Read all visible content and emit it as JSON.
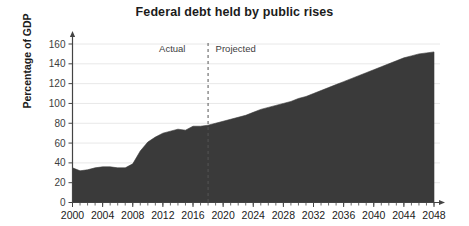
{
  "chart_data": {
    "type": "area",
    "title": "Federal debt held by public rises",
    "xlabel": "",
    "ylabel": "Percentage of GDP",
    "xlim": [
      2000,
      2048
    ],
    "ylim": [
      0,
      160
    ],
    "grid": true,
    "legend_position": "none",
    "yticks": [
      0,
      20,
      40,
      60,
      80,
      100,
      120,
      140,
      160
    ],
    "ytick_labels": [
      "0",
      "20",
      "40",
      "60",
      "80",
      "100",
      "120",
      "140",
      "160"
    ],
    "xticks": [
      2000,
      2004,
      2008,
      2012,
      2016,
      2020,
      2024,
      2028,
      2032,
      2036,
      2040,
      2044,
      2048
    ],
    "xtick_labels": [
      "2000",
      "2004",
      "2008",
      "2012",
      "2016",
      "2020",
      "2024",
      "2028",
      "2032",
      "2036",
      "2040",
      "2044",
      "2048"
    ],
    "minor_xtick_step": 1,
    "series": [
      {
        "name": "Federal debt held by the public",
        "color": "#3a3a3a",
        "x": [
          2000,
          2001,
          2002,
          2003,
          2004,
          2005,
          2006,
          2007,
          2008,
          2009,
          2010,
          2011,
          2012,
          2013,
          2014,
          2015,
          2016,
          2017,
          2018,
          2019,
          2020,
          2021,
          2022,
          2023,
          2024,
          2025,
          2026,
          2027,
          2028,
          2029,
          2030,
          2031,
          2032,
          2033,
          2034,
          2035,
          2036,
          2037,
          2038,
          2039,
          2040,
          2041,
          2042,
          2043,
          2044,
          2045,
          2046,
          2047,
          2048
        ],
        "values": [
          35,
          32,
          33,
          35,
          36,
          36,
          35,
          35,
          39,
          52,
          61,
          66,
          70,
          72,
          74,
          73,
          77,
          77,
          78,
          80,
          82,
          84,
          86,
          88,
          91,
          94,
          96,
          98,
          100,
          102,
          105,
          107,
          110,
          113,
          116,
          119,
          122,
          125,
          128,
          131,
          134,
          137,
          140,
          143,
          146,
          148,
          150,
          151,
          152
        ]
      }
    ],
    "annotations": [
      {
        "name": "divider",
        "type": "vline",
        "x": 2018,
        "style": "dashed",
        "color": "#555555"
      },
      {
        "name": "actual-label",
        "type": "text",
        "text": "Actual",
        "x": 2015,
        "y": 152,
        "align": "right"
      },
      {
        "name": "projected-label",
        "type": "text",
        "text": "Projected",
        "x": 2019,
        "y": 152,
        "align": "left"
      }
    ]
  },
  "colors": {
    "area_fill": "#3a3a3a",
    "axis": "#444444",
    "grid": "#e8e8e8",
    "divider": "#555555",
    "title": "#1b1b1b"
  }
}
